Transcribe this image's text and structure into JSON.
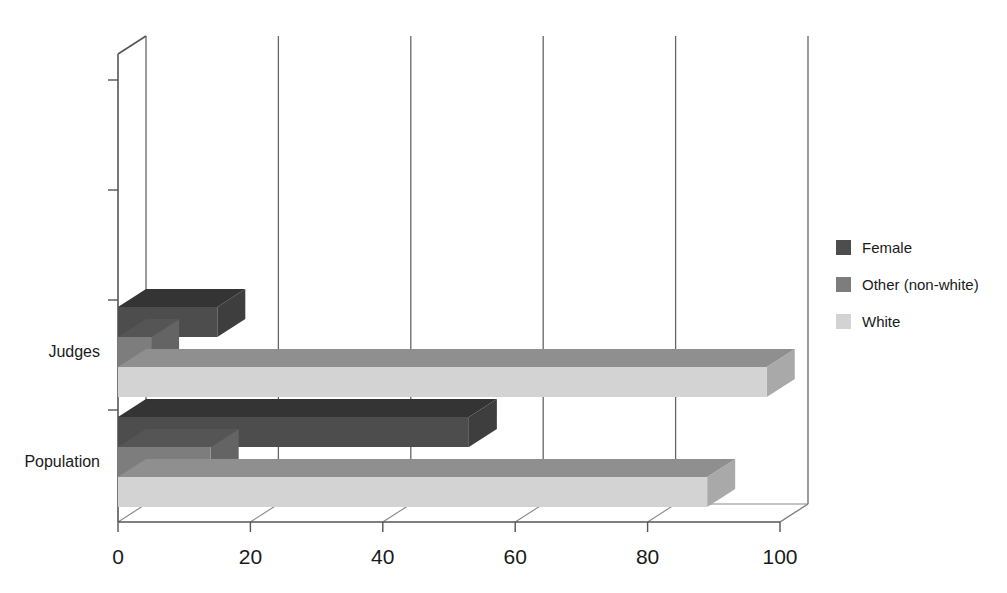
{
  "chart_data": {
    "type": "bar",
    "orientation": "horizontal",
    "style": "3d",
    "title": "",
    "subtitle": "",
    "xlabel": "",
    "ylabel": "",
    "categories": [
      "Judges",
      "Population"
    ],
    "series": [
      {
        "name": "Female",
        "values": [
          15,
          53
        ],
        "color": "#4d4d4d"
      },
      {
        "name": "Other (non-white)",
        "values": [
          5,
          14
        ],
        "color": "#7d7d7d"
      },
      {
        "name": "White",
        "values": [
          98,
          89
        ],
        "color": "#d3d3d3"
      }
    ],
    "xlim": [
      0,
      100
    ],
    "xticks": [
      0,
      20,
      40,
      60,
      80,
      100
    ],
    "xtick_labels": [
      "0",
      "20",
      "40",
      "60",
      "80",
      "100"
    ],
    "grid": true,
    "grid_axis": "x",
    "legend_position": "right"
  },
  "legend": {
    "items": [
      {
        "label": "Female",
        "color": "#4d4d4d"
      },
      {
        "label": "Other (non-white)",
        "color": "#7d7d7d"
      },
      {
        "label": "White",
        "color": "#d3d3d3"
      }
    ]
  },
  "axes": {
    "x_tick_labels": [
      "0",
      "20",
      "40",
      "60",
      "80",
      "100"
    ],
    "y_category_labels": [
      "Judges",
      "Population"
    ]
  },
  "colors": {
    "female": "#4d4d4d",
    "other_non_white": "#7d7d7d",
    "white_series": "#d3d3d3",
    "axis": "#555555",
    "grid": "#666666",
    "background": "#ffffff",
    "text": "#1a1a1a"
  }
}
